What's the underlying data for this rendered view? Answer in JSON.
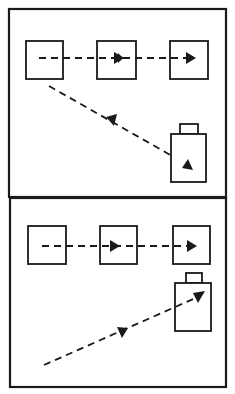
{
  "diagram": {
    "panels": [
      {
        "id": "top",
        "squares": 3,
        "horizontal_arrow": {
          "style": "dashed",
          "direction": "left-to-right",
          "arrowheads": 2
        },
        "diagonal_arrow": {
          "style": "dashed",
          "direction": "from first square down-right into battery",
          "arrowheads": 2
        },
        "battery": {
          "orientation": "upright",
          "terminal": "top"
        }
      },
      {
        "id": "bottom",
        "squares": 3,
        "horizontal_arrow": {
          "style": "dashed",
          "direction": "left-to-right",
          "arrowheads": 2
        },
        "diagonal_arrow": {
          "style": "dashed",
          "direction": "from lower-left up-right into battery",
          "arrowheads": 2
        },
        "battery": {
          "orientation": "upright",
          "terminal": "top"
        }
      }
    ],
    "colors": {
      "ink": "#1a1a1a",
      "paper": "#ffffff"
    }
  }
}
